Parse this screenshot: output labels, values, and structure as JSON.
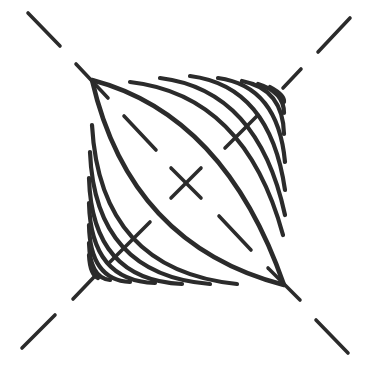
{
  "diagram": {
    "colors": {
      "background": "#ffffff",
      "ink": "#2b2b2b"
    },
    "stroke_width": 4.2,
    "lens": {
      "tip_top_left": [
        92,
        80
      ],
      "tip_bottom_right": [
        284,
        285
      ],
      "upper_curve_control": [
        225,
        115
      ],
      "lower_curve_control": [
        130,
        245
      ]
    },
    "center_mark": {
      "shape": "x",
      "center": [
        186,
        183
      ],
      "half_size": 15
    },
    "main_axis_dashes": [
      [
        [
          28,
          13
        ],
        [
          60,
          46
        ]
      ],
      [
        [
          76,
          64
        ],
        [
          108,
          98
        ]
      ],
      [
        [
          124,
          116
        ],
        [
          156,
          150
        ]
      ],
      [
        [
          219,
          216
        ],
        [
          251,
          250
        ]
      ],
      [
        [
          268,
          268
        ],
        [
          300,
          300
        ]
      ],
      [
        [
          316,
          320
        ],
        [
          348,
          353
        ]
      ]
    ],
    "cross_axis_dashes": [
      [
        [
          318,
          52
        ],
        [
          350,
          18
        ]
      ],
      [
        [
          283,
          88
        ],
        [
          301,
          69
        ]
      ],
      [
        [
          22,
          348
        ],
        [
          55,
          315
        ]
      ],
      [
        [
          73,
          299
        ],
        [
          95,
          276
        ]
      ]
    ],
    "upper_right_arcs": [
      {
        "start": [
          130,
          82
        ],
        "control": [
          245,
          95
        ],
        "end": [
          283,
          235
        ]
      },
      {
        "start": [
          160,
          78
        ],
        "control": [
          258,
          90
        ],
        "end": [
          285,
          215
        ]
      },
      {
        "start": [
          190,
          76
        ],
        "control": [
          270,
          86
        ],
        "end": [
          285,
          190
        ]
      },
      {
        "start": [
          218,
          78
        ],
        "control": [
          278,
          86
        ],
        "end": [
          285,
          162
        ]
      },
      {
        "start": [
          242,
          81
        ],
        "control": [
          283,
          89
        ],
        "end": [
          284,
          134
        ]
      },
      {
        "start": [
          258,
          84
        ],
        "control": [
          284,
          92
        ],
        "end": [
          284,
          113
        ]
      },
      {
        "start": [
          270,
          87
        ],
        "control": [
          285,
          95
        ],
        "end": [
          284,
          102
        ]
      }
    ],
    "lower_left_arcs": [
      {
        "start": [
          92,
          125
        ],
        "control": [
          100,
          270
        ],
        "end": [
          237,
          284
        ]
      },
      {
        "start": [
          90,
          152
        ],
        "control": [
          95,
          275
        ],
        "end": [
          210,
          284
        ]
      },
      {
        "start": [
          89,
          178
        ],
        "control": [
          92,
          280
        ],
        "end": [
          182,
          284
        ]
      },
      {
        "start": [
          89,
          203
        ],
        "control": [
          91,
          281
        ],
        "end": [
          155,
          283
        ]
      },
      {
        "start": [
          89,
          225
        ],
        "control": [
          90,
          280
        ],
        "end": [
          130,
          282
        ]
      },
      {
        "start": [
          89,
          243
        ],
        "control": [
          90,
          278
        ],
        "end": [
          110,
          280
        ]
      },
      {
        "start": [
          89,
          255
        ],
        "control": [
          90,
          275
        ],
        "end": [
          98,
          278
        ]
      }
    ]
  }
}
